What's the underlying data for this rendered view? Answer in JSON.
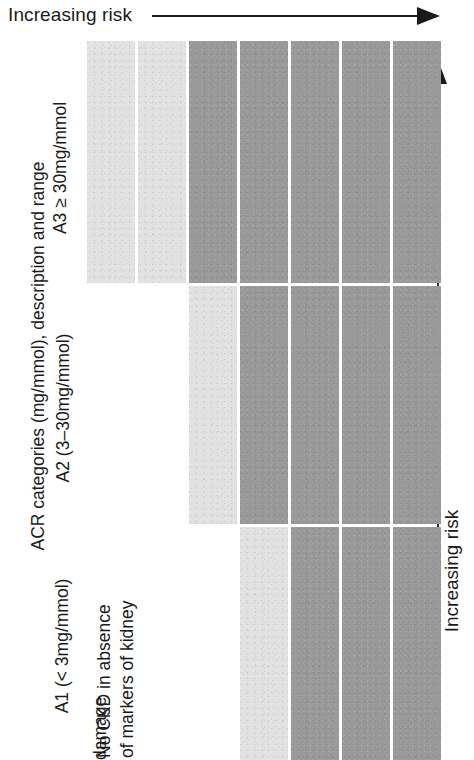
{
  "axes": {
    "top_label": "Increasing risk",
    "right_label": "Increasing risk",
    "left_title": "ACR categories (mg/mmol), description and range"
  },
  "categories": [
    {
      "id": "A3",
      "label": "A3 ≥ 30mg/mmol"
    },
    {
      "id": "A2",
      "label": "A2 (3–30mg/mmol)"
    },
    {
      "id": "A1",
      "label": "A1 (< 3mg/mmol)"
    }
  ],
  "note": {
    "lines": [
      "No CKD in absence",
      "of markers of kidney",
      "damage"
    ]
  },
  "colors": {
    "low": "#e2e2e2",
    "high": "#9a9a9a",
    "background": "#ffffff",
    "ink": "#1a1a1a"
  },
  "chart_data": {
    "type": "heatmap",
    "title": "",
    "xlabel": "Increasing risk",
    "ylabel": "ACR categories (mg/mmol), description and range",
    "grid": true,
    "legend": "none",
    "row_categories": [
      "A3 ≥ 30mg/mmol",
      "A2 (3–30mg/mmol)",
      "A1 (< 3mg/mmol)"
    ],
    "column_count": 7,
    "column_index": [
      1,
      2,
      3,
      4,
      5,
      6,
      7
    ],
    "note": "No CKD in absence of markers of kidney damage",
    "rows": [
      {
        "category": "A3 ≥ 30mg/mmol",
        "start_column": 1,
        "cells": [
          {
            "column": 1,
            "risk": "low",
            "color": "#e2e2e2"
          },
          {
            "column": 2,
            "risk": "low",
            "color": "#e2e2e2"
          },
          {
            "column": 3,
            "risk": "high",
            "color": "#9a9a9a"
          },
          {
            "column": 4,
            "risk": "high",
            "color": "#9a9a9a"
          },
          {
            "column": 5,
            "risk": "high",
            "color": "#9a9a9a"
          },
          {
            "column": 6,
            "risk": "high",
            "color": "#9a9a9a"
          },
          {
            "column": 7,
            "risk": "high",
            "color": "#9a9a9a"
          }
        ]
      },
      {
        "category": "A2 (3–30mg/mmol)",
        "start_column": 3,
        "cells": [
          {
            "column": 3,
            "risk": "low",
            "color": "#e2e2e2"
          },
          {
            "column": 4,
            "risk": "high",
            "color": "#9a9a9a"
          },
          {
            "column": 5,
            "risk": "high",
            "color": "#9a9a9a"
          },
          {
            "column": 6,
            "risk": "high",
            "color": "#9a9a9a"
          },
          {
            "column": 7,
            "risk": "high",
            "color": "#9a9a9a"
          }
        ]
      },
      {
        "category": "A1 (< 3mg/mmol)",
        "start_column": 4,
        "cells": [
          {
            "column": 4,
            "risk": "low",
            "color": "#e2e2e2"
          },
          {
            "column": 5,
            "risk": "high",
            "color": "#9a9a9a"
          },
          {
            "column": 6,
            "risk": "high",
            "color": "#9a9a9a"
          },
          {
            "column": 7,
            "risk": "high",
            "color": "#9a9a9a"
          }
        ]
      }
    ]
  },
  "layout": {
    "grid_left": 87,
    "grid_right": 423,
    "col_width": 48,
    "gutter": 3,
    "rows": [
      {
        "top": 41,
        "height": 242
      },
      {
        "top": 286,
        "height": 238
      },
      {
        "top": 527,
        "height": 233
      }
    ]
  }
}
